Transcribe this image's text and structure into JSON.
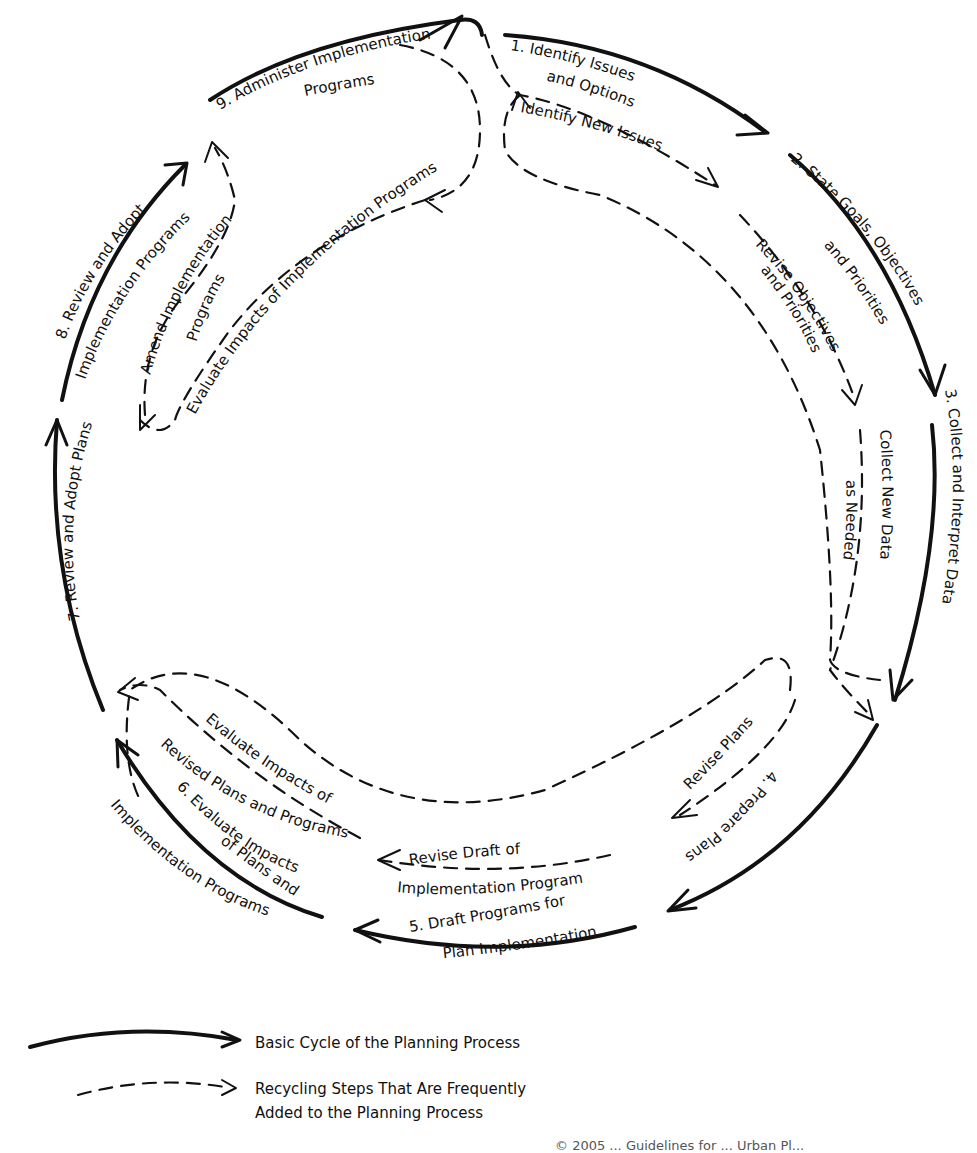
{
  "steps": [
    {
      "number": "1.",
      "line1": "1. Identify Issues",
      "line2": "and Options"
    },
    {
      "number": "2.",
      "line1": "2. State Goals, Objectives",
      "line2": "and Priorities"
    },
    {
      "number": "3.",
      "line1": "3. Collect and Interpret Data"
    },
    {
      "number": "4.",
      "line1": "4. Prepare Plans"
    },
    {
      "number": "5.",
      "line1": "5. Draft Programs for",
      "line2": "Plan Implementation"
    },
    {
      "number": "6.",
      "line1": "6. Evaluate Impacts",
      "line2": "of Plans and",
      "line3": "Implementation Programs"
    },
    {
      "number": "7.",
      "line1": "7. Review and Adopt Plans"
    },
    {
      "number": "8.",
      "line1": "8. Review and Adopt",
      "line2": "Implementation Programs"
    },
    {
      "number": "9.",
      "line1": "9. Administer Implementation",
      "line2": "Programs"
    }
  ],
  "recycling_steps": {
    "identify_new_issues": "Identify New Issues",
    "revise_objectives": {
      "line1": "Revise Objectives",
      "line2": "and Priorities"
    },
    "collect_new_data": {
      "line1": "Collect New Data",
      "line2": "as Needed"
    },
    "revise_plans": "Revise Plans",
    "revise_draft": {
      "line1": "Revise Draft of",
      "line2": "Implementation Program"
    },
    "evaluate_revised": {
      "line1": "Evaluate Impacts of",
      "line2": "Revised Plans and Programs"
    },
    "amend_programs": {
      "line1": "Amend  Implementation",
      "line2": "Programs"
    },
    "evaluate_impl": "Evaluate Impacts of Implementation Programs"
  },
  "legend": {
    "solid": "Basic Cycle of the Planning Process",
    "dashed_line1": "Recycling Steps That Are Frequently",
    "dashed_line2": "Added to the Planning Process"
  },
  "footer": "© 2005 ...   Guidelines for ... Urban Pl..."
}
